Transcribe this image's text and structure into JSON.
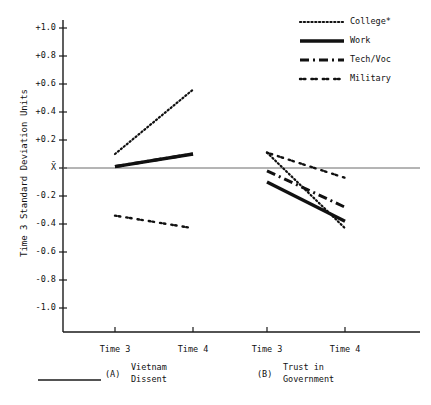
{
  "figure": {
    "y_axis_title": "Time 3 Standard Deviation Units",
    "footnote_rule": true
  },
  "legend": {
    "entries": [
      {
        "label": "College*",
        "style": "fine-dotted"
      },
      {
        "label": "Work",
        "style": "solid"
      },
      {
        "label": "Tech/Voc",
        "style": "dash-dot"
      },
      {
        "label": "Military",
        "style": "dot-pair"
      }
    ]
  },
  "chart_data": {
    "type": "line",
    "title": "",
    "xlabel": "",
    "ylabel": "Time 3 Standard Deviation Units",
    "ylim": [
      -1.2,
      1.1
    ],
    "yticks": [
      "+1.0",
      "+0.8",
      "+0.6",
      "+0.4",
      "+0.2",
      "X̄",
      "-0.2",
      "-0.4",
      "-0.6",
      "-0.8",
      "-1.0"
    ],
    "ytick_values": [
      1.0,
      0.8,
      0.6,
      0.4,
      0.2,
      0.0,
      -0.2,
      -0.4,
      -0.6,
      -0.8,
      -1.0
    ],
    "grid": false,
    "reference_line": {
      "value": 0.0,
      "label": "X̄"
    },
    "legend_position": "top-right",
    "panels": [
      {
        "key": "A",
        "panel_label": "(A)",
        "caption_line1": "Vietnam",
        "caption_line2": "Dissent",
        "x": [
          "Time 3",
          "Time 4"
        ],
        "series": [
          {
            "name": "College*",
            "values": [
              0.1,
              0.56
            ]
          },
          {
            "name": "Work",
            "values": [
              0.01,
              0.1
            ]
          },
          {
            "name": "Tech/Voc",
            "values": [
              0.01,
              0.1
            ]
          },
          {
            "name": "Military",
            "values": [
              -0.34,
              -0.43
            ]
          }
        ]
      },
      {
        "key": "B",
        "panel_label": "(B)",
        "caption_line1": "Trust in",
        "caption_line2": "Government",
        "x": [
          "Time 3",
          "Time 4"
        ],
        "series": [
          {
            "name": "College*",
            "values": [
              0.11,
              -0.43
            ]
          },
          {
            "name": "Work",
            "values": [
              -0.1,
              -0.38
            ]
          },
          {
            "name": "Tech/Voc",
            "values": [
              -0.02,
              -0.28
            ]
          },
          {
            "name": "Military",
            "values": [
              0.11,
              -0.07
            ]
          }
        ]
      }
    ]
  },
  "axis_labels": {
    "panelA_t3": "Time 3",
    "panelA_t4": "Time 4",
    "panelB_t3": "Time 3",
    "panelB_t4": "Time 4"
  }
}
